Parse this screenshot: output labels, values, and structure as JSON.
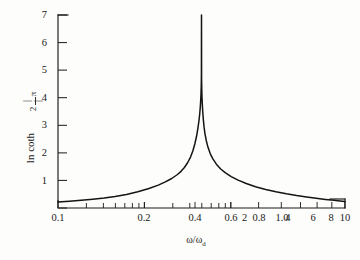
{
  "figure": {
    "background_color": "#fdfdfb",
    "ink_color": "#1a1a1a",
    "curve_color": "#141414"
  },
  "axis_labels": {
    "y_prefix": "ln coth",
    "y_fraction_numerator": "π",
    "y_fraction_denominator": "2",
    "y_bar_left": "|",
    "y_bar_right": "|",
    "x_title_numerator": "ω",
    "x_title_slash": "/",
    "x_title_denominator": "ω",
    "x_title_subscript": "d"
  },
  "chart_data": {
    "type": "line",
    "title": "",
    "subtitle": "",
    "xlabel": "ω/ωₔ",
    "ylabel": "ln coth |π/2|",
    "xscale": "log",
    "yscale": "linear",
    "xlim": [
      0.1,
      10
    ],
    "ylim": [
      0,
      7
    ],
    "grid": false,
    "legend": false,
    "legend_position": "none",
    "x_tick_labels": [
      "0.1",
      "0.2",
      "0.4",
      "0.6",
      "0.8",
      "1.0",
      "2",
      "4",
      "6",
      "8",
      "10"
    ],
    "x_tick_values": [
      0.1,
      0.2,
      0.4,
      0.6,
      0.8,
      1.0,
      2,
      4,
      6,
      8,
      10
    ],
    "x_minor_ticks": [
      0.2,
      0.3,
      0.4,
      0.5,
      0.6,
      0.7,
      0.8,
      0.9,
      1.0,
      2,
      3,
      4,
      5,
      6,
      7,
      8,
      9,
      10
    ],
    "y_tick_labels": [
      "1",
      "2",
      "3",
      "4",
      "5",
      "6",
      "7"
    ],
    "y_tick_values": [
      1,
      2,
      3,
      4,
      5,
      6,
      7
    ],
    "series": [
      {
        "name": "ln coth |π/2|",
        "x": [
          0.1,
          0.12,
          0.145,
          0.175,
          0.21,
          0.25,
          0.3,
          0.36,
          0.43,
          0.5,
          0.56,
          0.62,
          0.68,
          0.72,
          0.76,
          0.8,
          0.84,
          0.87,
          0.9,
          0.925,
          0.945,
          0.96,
          0.972,
          0.98,
          0.987,
          0.992,
          0.996,
          0.9985,
          1.0,
          1.0015,
          1.004,
          1.008,
          1.013,
          1.02,
          1.029,
          1.041,
          1.057,
          1.08,
          1.11,
          1.15,
          1.2,
          1.27,
          1.36,
          1.47,
          1.61,
          1.8,
          2.05,
          2.38,
          2.8,
          3.3,
          3.9,
          4.6,
          5.4,
          6.3,
          7.3,
          8.4,
          9.2,
          10.0
        ],
        "y": [
          0.222,
          0.247,
          0.278,
          0.315,
          0.36,
          0.415,
          0.49,
          0.59,
          0.71,
          0.83,
          0.945,
          1.07,
          1.215,
          1.33,
          1.47,
          1.64,
          1.855,
          2.065,
          2.34,
          2.62,
          2.91,
          3.165,
          3.42,
          3.64,
          3.89,
          4.13,
          4.43,
          4.81,
          7.0,
          4.68,
          4.33,
          4.01,
          3.77,
          3.5,
          3.23,
          2.96,
          2.7,
          2.44,
          2.2,
          1.975,
          1.78,
          1.59,
          1.415,
          1.275,
          1.14,
          1.01,
          0.89,
          0.77,
          0.672,
          0.59,
          0.516,
          0.452,
          0.398,
          0.352,
          0.312,
          0.278,
          0.258,
          0.24
        ]
      }
    ],
    "annotations": [
      {
        "text": "vertical asymptote at ω/ωₔ = 1",
        "x": 1.0
      }
    ]
  }
}
